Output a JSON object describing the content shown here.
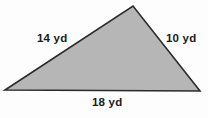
{
  "figure": {
    "name": "triangle-with-side-lengths",
    "shape": "triangle",
    "units": "yd",
    "background_color": "#fdfdfd",
    "fill_color": "#b6b6b6",
    "stroke_color": "#2b2b2b",
    "text_color": "#1b1b1b",
    "vertices": {
      "left": {
        "x": 5,
        "y": 90
      },
      "apex": {
        "x": 133,
        "y": 6
      },
      "right": {
        "x": 200,
        "y": 91
      }
    },
    "labels": {
      "left_side": "14 yd",
      "right_side": "10 yd",
      "base": "18 yd"
    }
  }
}
